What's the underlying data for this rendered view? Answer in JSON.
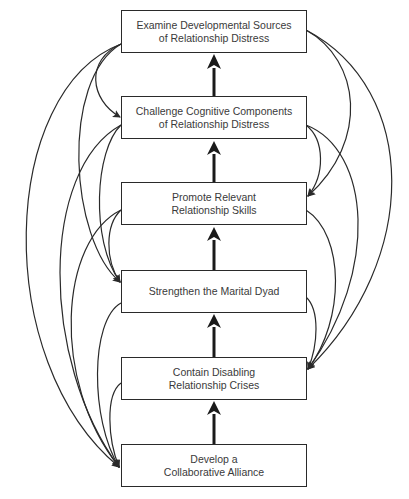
{
  "diagram": {
    "type": "flowchart",
    "nodes": [
      {
        "id": "n1",
        "lines": [
          "Examine Developmental Sources",
          "of Relationship Distress"
        ]
      },
      {
        "id": "n2",
        "lines": [
          "Challenge Cognitive Components",
          "of Relationship Distress"
        ]
      },
      {
        "id": "n3",
        "lines": [
          "Promote Relevant",
          "Relationship Skills"
        ]
      },
      {
        "id": "n4",
        "lines": [
          "Strengthen the Marital Dyad"
        ]
      },
      {
        "id": "n5",
        "lines": [
          "Contain Disabling",
          "Relationship Crises"
        ]
      },
      {
        "id": "n6",
        "lines": [
          "Develop a",
          "Collaborative Alliance"
        ]
      }
    ],
    "edges": {
      "center_upward": [
        [
          "n6",
          "n5"
        ],
        [
          "n5",
          "n4"
        ],
        [
          "n4",
          "n3"
        ],
        [
          "n3",
          "n2"
        ],
        [
          "n2",
          "n1"
        ]
      ],
      "left_downward": [
        [
          "n1",
          "n2"
        ],
        [
          "n1",
          "n4"
        ],
        [
          "n1",
          "n6"
        ],
        [
          "n2",
          "n4"
        ],
        [
          "n2",
          "n6"
        ],
        [
          "n3",
          "n4"
        ],
        [
          "n3",
          "n6"
        ],
        [
          "n4",
          "n6"
        ],
        [
          "n5",
          "n6"
        ]
      ],
      "right_downward": [
        [
          "n1",
          "n3"
        ],
        [
          "n1",
          "n5"
        ],
        [
          "n2",
          "n3"
        ],
        [
          "n2",
          "n5"
        ],
        [
          "n3",
          "n5"
        ],
        [
          "n4",
          "n5"
        ]
      ]
    },
    "colors": {
      "line": "#2a2a2a",
      "text": "#3a3a3a",
      "background": "#ffffff"
    }
  }
}
